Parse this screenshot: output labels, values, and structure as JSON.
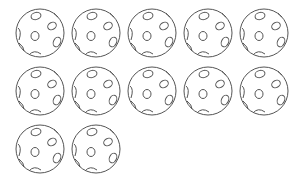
{
  "figure": {
    "count": 12,
    "rows": [
      5,
      5,
      2
    ],
    "stroke_color": "#555555",
    "background": "#ffffff"
  },
  "balls": [
    {
      "row": 0,
      "col": 0
    },
    {
      "row": 0,
      "col": 1
    },
    {
      "row": 0,
      "col": 2
    },
    {
      "row": 0,
      "col": 3
    },
    {
      "row": 0,
      "col": 4
    },
    {
      "row": 1,
      "col": 0
    },
    {
      "row": 1,
      "col": 1
    },
    {
      "row": 1,
      "col": 2
    },
    {
      "row": 1,
      "col": 3
    },
    {
      "row": 1,
      "col": 4
    },
    {
      "row": 2,
      "col": 0
    },
    {
      "row": 2,
      "col": 1
    }
  ]
}
